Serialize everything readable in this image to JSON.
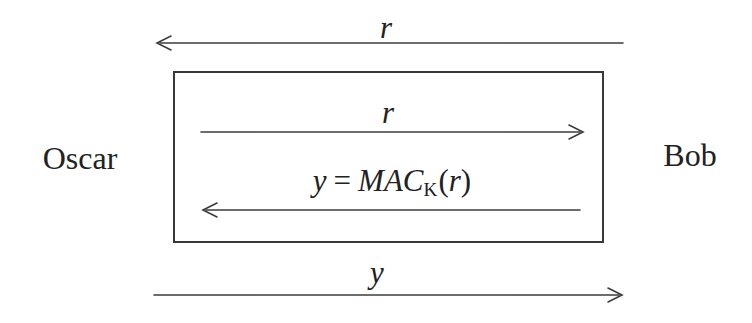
{
  "diagram": {
    "actors": {
      "left": "Oscar",
      "right": "Bob"
    },
    "outer_challenge": {
      "label": "r",
      "direction": "left"
    },
    "inner_challenge": {
      "label": "r",
      "direction": "right"
    },
    "inner_response": {
      "direction": "left",
      "var": "y",
      "eq": "=",
      "fn": "MAC",
      "sub": "K",
      "open": "(",
      "arg": "r",
      "close": ")"
    },
    "outer_response": {
      "label": "y",
      "direction": "right"
    }
  },
  "colors": {
    "background": "#ffffff",
    "line": "#3c3c3c",
    "text": "#222222"
  }
}
